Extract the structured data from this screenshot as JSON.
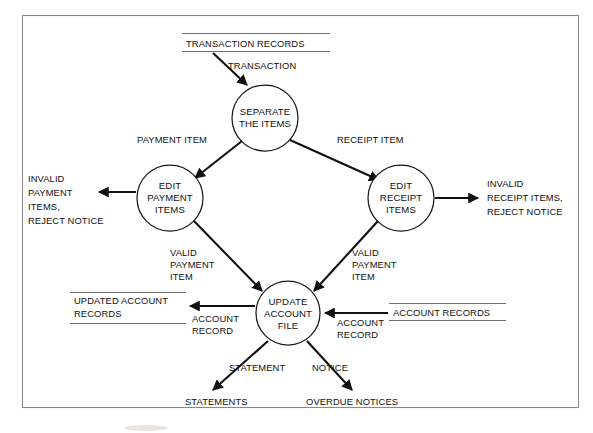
{
  "diagram": {
    "type": "data-flow-diagram",
    "title": "",
    "frame": {
      "visible": true,
      "color": "#8a8a8a"
    },
    "processes": [
      {
        "id": "separate",
        "lines": [
          "SEPARATE",
          "THE ITEMS"
        ],
        "cx": 265,
        "cy": 118,
        "r": 33
      },
      {
        "id": "edit-pay",
        "lines": [
          "EDIT",
          "PAYMENT",
          "ITEMS"
        ],
        "cx": 170,
        "cy": 198,
        "r": 33
      },
      {
        "id": "edit-recpt",
        "lines": [
          "EDIT",
          "RECEIPT",
          "ITEMS"
        ],
        "cx": 401,
        "cy": 198,
        "r": 33
      },
      {
        "id": "update",
        "lines": [
          "UPDATE",
          "ACCOUNT",
          "FILE"
        ],
        "cx": 288,
        "cy": 313,
        "r": 32
      }
    ],
    "data_stores": [
      {
        "id": "transaction-records",
        "lines": [
          "TRANSACTION RECORDS"
        ],
        "x": 186,
        "y": 41,
        "width": 145
      },
      {
        "id": "updated-account-records",
        "lines": [
          "UPDATED ACCOUNT",
          "RECORDS"
        ],
        "x": 74,
        "y": 298,
        "width": 110
      },
      {
        "id": "account-records",
        "lines": [
          "ACCOUNT RECORDS"
        ],
        "x": 393,
        "y": 311,
        "width": 112
      }
    ],
    "external_outputs": [
      {
        "id": "invalid-payment",
        "lines": [
          "INVALID",
          "PAYMENT",
          "ITEMS,",
          "REJECT NOTICE"
        ],
        "x": 28,
        "y": 176,
        "align": "left"
      },
      {
        "id": "invalid-receipt",
        "lines": [
          "INVALID",
          "RECEIPT ITEMS,",
          "REJECT NOTICE"
        ],
        "x": 487,
        "y": 182,
        "align": "left"
      },
      {
        "id": "statements",
        "lines": [
          "STATEMENTS"
        ],
        "x": 185,
        "y": 400,
        "align": "left"
      },
      {
        "id": "overdue-notices",
        "lines": [
          "OVERDUE NOTICES"
        ],
        "x": 306,
        "y": 400,
        "align": "left"
      }
    ],
    "flows": [
      {
        "id": "transaction",
        "label": "TRANSACTION",
        "lx": 228,
        "ly": 66,
        "from": "transaction-records",
        "to": "separate"
      },
      {
        "id": "payment-item",
        "label": "PAYMENT ITEM",
        "lx": 137,
        "ly": 140,
        "from": "separate",
        "to": "edit-pay"
      },
      {
        "id": "receipt-item",
        "label": "RECEIPT ITEM",
        "lx": 337,
        "ly": 140,
        "from": "separate",
        "to": "edit-recpt"
      },
      {
        "id": "invalid-pay-flow",
        "label": "",
        "lx": 0,
        "ly": 0,
        "from": "edit-pay",
        "to": "invalid-payment"
      },
      {
        "id": "invalid-recpt-flow",
        "label": "",
        "lx": 0,
        "ly": 0,
        "from": "edit-recpt",
        "to": "invalid-receipt"
      },
      {
        "id": "valid-payment-left",
        "label": "VALID PAYMENT ITEM",
        "lx": 170,
        "ly": 252,
        "from": "edit-pay",
        "to": "update"
      },
      {
        "id": "valid-payment-right",
        "label": "VALID PAYMENT ITEM",
        "lx": 352,
        "ly": 252,
        "from": "edit-recpt",
        "to": "update"
      },
      {
        "id": "account-record-left",
        "label": "ACCOUNT RECORD",
        "lx": 192,
        "ly": 320,
        "from": "update",
        "to": "updated-account-records"
      },
      {
        "id": "account-record-right",
        "label": "ACCOUNT RECORD",
        "lx": 337,
        "ly": 320,
        "from": "account-records",
        "to": "update"
      },
      {
        "id": "statement",
        "label": "STATEMENT",
        "lx": 229,
        "ly": 368,
        "from": "update",
        "to": "statements"
      },
      {
        "id": "notice",
        "label": "NOTICE",
        "lx": 312,
        "ly": 368,
        "from": "update",
        "to": "overdue-notices"
      }
    ],
    "flow_label_groups": {
      "valid_payment_left": [
        "VALID",
        "PAYMENT",
        "ITEM"
      ],
      "valid_payment_right": [
        "VALID",
        "PAYMENT",
        "ITEM"
      ],
      "account_record_left": [
        "ACCOUNT",
        "RECORD"
      ],
      "account_record_right": [
        "ACCOUNT",
        "RECORD"
      ]
    }
  }
}
